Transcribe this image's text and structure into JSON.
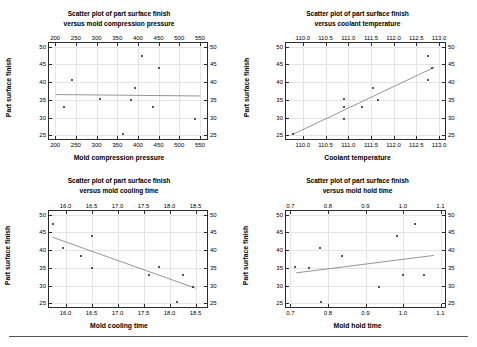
{
  "page": {
    "background": "#ffffff",
    "point_color": "#222222",
    "line_color": "#7a7a7a",
    "frame_color": "#2b2b2b",
    "grid_color": "#e4e4e4"
  },
  "chart_data": [
    {
      "id": "mold-compression-pressure",
      "type": "scatter",
      "title": "Scatter plot of part surface finish versus mold compression pressure",
      "title_line1": "Scatter plot of part surface finish",
      "title_line2": "versus mold compression pressure",
      "xlabel": "Mold compression pressure",
      "ylabel": "Part surface finish",
      "xlim": [
        185,
        567
      ],
      "ylim": [
        24,
        51
      ],
      "xticks": [
        200,
        250,
        300,
        350,
        400,
        450,
        500,
        550
      ],
      "xticklabels": [
        "200",
        "250",
        "300",
        "350",
        "400",
        "450",
        "500",
        "550"
      ],
      "yticks": [
        25,
        30,
        35,
        40,
        45,
        50
      ],
      "yticklabels": [
        "25",
        "30",
        "35",
        "40",
        "45",
        "50"
      ],
      "grid": true,
      "legend": "none",
      "x": [
        222,
        241,
        309,
        363,
        384,
        393,
        409,
        437,
        451,
        539
      ],
      "y": [
        33.0,
        40.7,
        35.2,
        25.4,
        35.1,
        38.4,
        47.3,
        33.0,
        43.9,
        29.7
      ],
      "fit_line": {
        "x0": 201,
        "y0": 36.5,
        "x1": 551,
        "y1": 36.1
      }
    },
    {
      "id": "coolant-temperature",
      "type": "scatter",
      "title": "Scatter plot of part surface finish versus coolant temperature",
      "title_line1": "Scatter plot of part surface finish",
      "title_line2": "versus coolant temperature",
      "xlabel": "Coolant temperature",
      "ylabel": "Part surface finish",
      "xlim": [
        109.63,
        113.13
      ],
      "ylim": [
        24,
        51
      ],
      "xticks": [
        110.0,
        110.5,
        111.0,
        111.5,
        112.0,
        112.5,
        113.0
      ],
      "xticklabels": [
        "110.0",
        "110.5",
        "111.0",
        "111.5",
        "112.0",
        "112.5",
        "113.0"
      ],
      "yticks": [
        25,
        30,
        35,
        40,
        45,
        50
      ],
      "yticklabels": [
        "25",
        "30",
        "35",
        "40",
        "45",
        "50"
      ],
      "grid": true,
      "legend": "none",
      "x": [
        109.78,
        110.9,
        110.9,
        110.9,
        111.3,
        111.55,
        111.65,
        112.75,
        112.75,
        112.85
      ],
      "y": [
        25.4,
        35.2,
        33.0,
        29.7,
        33.0,
        38.4,
        35.1,
        47.3,
        40.7,
        43.9
      ],
      "fit_line": {
        "x0": 109.78,
        "y0": 25.3,
        "x1": 112.9,
        "y1": 44.2
      }
    },
    {
      "id": "mold-cooling-time",
      "type": "scatter",
      "title": "Scatter plot of part surface finish versus mold cooling time",
      "title_line1": "Scatter plot of part surface finish",
      "title_line2": "versus mold cooling time",
      "xlabel": "Mold cooling time",
      "ylabel": "Part surface finish",
      "xlim": [
        15.68,
        18.72
      ],
      "ylim": [
        24,
        51
      ],
      "xticks": [
        16.0,
        16.5,
        17.0,
        17.5,
        18.0,
        18.5
      ],
      "xticklabels": [
        "16.0",
        "16.5",
        "17.0",
        "17.5",
        "18.0",
        "18.5"
      ],
      "yticks": [
        25,
        30,
        35,
        40,
        45,
        50
      ],
      "yticklabels": [
        "25",
        "30",
        "35",
        "40",
        "45",
        "50"
      ],
      "grid": true,
      "legend": "none",
      "x": [
        15.75,
        15.95,
        16.3,
        16.5,
        16.5,
        17.6,
        17.8,
        18.15,
        18.25,
        18.45
      ],
      "y": [
        47.3,
        40.7,
        38.4,
        43.9,
        35.1,
        33.0,
        35.2,
        25.4,
        33.0,
        29.7
      ],
      "fit_line": {
        "x0": 15.75,
        "y0": 43.6,
        "x1": 18.5,
        "y1": 29.3
      }
    },
    {
      "id": "mold-hold-time",
      "type": "scatter",
      "title": "Scatter plot of part surface finish versus mold hold time",
      "title_line1": "Scatter plot of part surface finish",
      "title_line2": "versus mold hold time",
      "xlabel": "Mold hold time",
      "ylabel": "Part surface finish",
      "xlim": [
        0.688,
        1.112
      ],
      "ylim": [
        24,
        51
      ],
      "xticks": [
        0.7,
        0.8,
        0.9,
        1.0,
        1.1
      ],
      "xticklabels": [
        "0.7",
        "0.8",
        "0.9",
        "1.0",
        "1.1"
      ],
      "yticks": [
        25,
        30,
        35,
        40,
        45,
        50
      ],
      "yticklabels": [
        "25",
        "30",
        "35",
        "40",
        "45",
        "50"
      ],
      "grid": true,
      "legend": "none",
      "x": [
        0.712,
        0.748,
        0.778,
        0.782,
        0.838,
        0.935,
        0.985,
        1.0,
        1.032,
        1.055
      ],
      "y": [
        35.2,
        35.1,
        40.7,
        25.4,
        38.4,
        29.7,
        43.9,
        33.0,
        47.3,
        33.0
      ],
      "fit_line": {
        "x0": 0.715,
        "y0": 33.6,
        "x1": 1.082,
        "y1": 38.5
      }
    }
  ]
}
